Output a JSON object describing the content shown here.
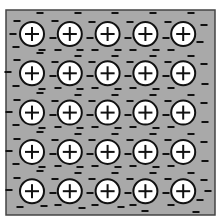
{
  "diagram": {
    "title": "Metallic bonding: lattice of positive ions in a sea of delocalized electrons",
    "colors": {
      "background": "#ffffff",
      "sea": "#a9a9a9",
      "border": "#444444",
      "ion_fill": "#ffffff",
      "ion_stroke": "#111111",
      "electron": "#111111"
    },
    "lattice": {
      "rows": 5,
      "cols": 5,
      "ion_symbol": "+",
      "electron_symbol": "−",
      "ion_radius": 12,
      "origin_x": 32,
      "origin_y": 34,
      "spacing_x": 37.8,
      "spacing_y": 39.3
    },
    "frame": {
      "x": 6,
      "y": 10,
      "width": 209,
      "height": 205
    },
    "electrons": [
      [
        17,
        21
      ],
      [
        40,
        13
      ],
      [
        13,
        34
      ],
      [
        16,
        47
      ],
      [
        42,
        50
      ],
      [
        55,
        21
      ],
      [
        78,
        13
      ],
      [
        53,
        38
      ],
      [
        58,
        50
      ],
      [
        80,
        50
      ],
      [
        92,
        22
      ],
      [
        115,
        13
      ],
      [
        90,
        38
      ],
      [
        95,
        50
      ],
      [
        118,
        50
      ],
      [
        130,
        22
      ],
      [
        153,
        13
      ],
      [
        128,
        38
      ],
      [
        133,
        50
      ],
      [
        156,
        50
      ],
      [
        168,
        22
      ],
      [
        191,
        13
      ],
      [
        166,
        38
      ],
      [
        171,
        50
      ],
      [
        200,
        42
      ],
      [
        204,
        25
      ],
      [
        17,
        60
      ],
      [
        40,
        53
      ],
      [
        8,
        72
      ],
      [
        16,
        86
      ],
      [
        42,
        89
      ],
      [
        55,
        62
      ],
      [
        78,
        56
      ],
      [
        53,
        76
      ],
      [
        58,
        88
      ],
      [
        80,
        89
      ],
      [
        92,
        62
      ],
      [
        115,
        56
      ],
      [
        90,
        76
      ],
      [
        95,
        88
      ],
      [
        118,
        89
      ],
      [
        130,
        62
      ],
      [
        153,
        56
      ],
      [
        128,
        76
      ],
      [
        133,
        88
      ],
      [
        156,
        89
      ],
      [
        168,
        62
      ],
      [
        191,
        56
      ],
      [
        166,
        76
      ],
      [
        171,
        88
      ],
      [
        204,
        64
      ],
      [
        205,
        84
      ],
      [
        17,
        100
      ],
      [
        40,
        93
      ],
      [
        9,
        112
      ],
      [
        16,
        125
      ],
      [
        42,
        128
      ],
      [
        55,
        101
      ],
      [
        78,
        95
      ],
      [
        53,
        115
      ],
      [
        58,
        127
      ],
      [
        80,
        128
      ],
      [
        92,
        101
      ],
      [
        115,
        95
      ],
      [
        90,
        115
      ],
      [
        95,
        127
      ],
      [
        118,
        128
      ],
      [
        130,
        101
      ],
      [
        153,
        95
      ],
      [
        128,
        115
      ],
      [
        133,
        127
      ],
      [
        156,
        128
      ],
      [
        168,
        101
      ],
      [
        191,
        95
      ],
      [
        166,
        115
      ],
      [
        171,
        127
      ],
      [
        204,
        103
      ],
      [
        205,
        122
      ],
      [
        17,
        139
      ],
      [
        40,
        132
      ],
      [
        9,
        151
      ],
      [
        16,
        164
      ],
      [
        42,
        167
      ],
      [
        55,
        140
      ],
      [
        78,
        134
      ],
      [
        53,
        154
      ],
      [
        58,
        166
      ],
      [
        80,
        167
      ],
      [
        92,
        140
      ],
      [
        115,
        134
      ],
      [
        90,
        154
      ],
      [
        95,
        166
      ],
      [
        118,
        167
      ],
      [
        130,
        140
      ],
      [
        153,
        134
      ],
      [
        128,
        154
      ],
      [
        133,
        166
      ],
      [
        156,
        167
      ],
      [
        168,
        140
      ],
      [
        191,
        134
      ],
      [
        166,
        154
      ],
      [
        171,
        166
      ],
      [
        204,
        142
      ],
      [
        205,
        161
      ],
      [
        17,
        178
      ],
      [
        40,
        171
      ],
      [
        9,
        190
      ],
      [
        20,
        207
      ],
      [
        44,
        206
      ],
      [
        55,
        179
      ],
      [
        78,
        173
      ],
      [
        53,
        193
      ],
      [
        58,
        205
      ],
      [
        82,
        208
      ],
      [
        92,
        179
      ],
      [
        115,
        173
      ],
      [
        90,
        193
      ],
      [
        95,
        205
      ],
      [
        121,
        207
      ],
      [
        130,
        179
      ],
      [
        153,
        173
      ],
      [
        128,
        193
      ],
      [
        133,
        205
      ],
      [
        145,
        211
      ],
      [
        168,
        179
      ],
      [
        191,
        173
      ],
      [
        166,
        193
      ],
      [
        171,
        205
      ],
      [
        200,
        200
      ],
      [
        204,
        180
      ],
      [
        208,
        191
      ],
      [
        196,
        212
      ]
    ]
  }
}
